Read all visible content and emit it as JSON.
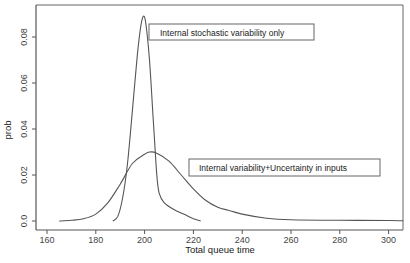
{
  "chart_data": {
    "type": "line",
    "title": "",
    "xlabel": "Total queue time",
    "ylabel": "prob",
    "xlim": [
      155,
      306
    ],
    "ylim": [
      -0.003,
      0.093
    ],
    "grid": false,
    "legend": "none (inline boxed annotations)",
    "x_ticks": [
      160,
      180,
      200,
      220,
      240,
      260,
      280,
      300
    ],
    "x_tick_labels": [
      "160",
      "180",
      "200",
      "220",
      "240",
      "260",
      "280",
      "300"
    ],
    "y_ticks": [
      0.0,
      0.02,
      0.04,
      0.06,
      0.08
    ],
    "y_tick_labels": [
      "0.0",
      "0.02",
      "0.04",
      "0.06",
      "0.08"
    ],
    "series": [
      {
        "name": "Internal stochastic variability only",
        "x": [
          187,
          189,
          191,
          193,
          195,
          197,
          198.5,
          199.5,
          200.5,
          202,
          203.5,
          205,
          206,
          208,
          212,
          216,
          220,
          223
        ],
        "values": [
          0.0,
          0.002,
          0.01,
          0.025,
          0.048,
          0.072,
          0.085,
          0.089,
          0.086,
          0.07,
          0.045,
          0.02,
          0.012,
          0.008,
          0.005,
          0.003,
          0.001,
          0.0
        ]
      },
      {
        "name": "Internal variability+Uncertainty in inputs",
        "x": [
          165,
          170,
          175,
          180,
          185,
          190,
          195,
          200,
          202,
          205,
          210,
          215,
          220,
          225,
          230,
          235,
          240,
          250,
          260,
          280,
          300,
          306
        ],
        "values": [
          0.0,
          0.0003,
          0.001,
          0.003,
          0.008,
          0.016,
          0.025,
          0.029,
          0.03,
          0.0295,
          0.026,
          0.02,
          0.014,
          0.009,
          0.006,
          0.0045,
          0.003,
          0.0012,
          0.0005,
          0.0003,
          0.0002,
          0.0001
        ]
      }
    ],
    "annotations": [
      {
        "text": "Internal stochastic variability only",
        "attached_to": "Internal stochastic variability only",
        "position": "right of narrow peak, near top"
      },
      {
        "text": "Internal variability+Uncertainty in inputs",
        "attached_to": "Internal variability+Uncertainty in inputs",
        "position": "right of wide peak"
      }
    ]
  },
  "axes": {
    "xlabel": "Total queue time",
    "ylabel": "prob"
  },
  "annotations": {
    "narrow": "Internal stochastic variability only",
    "wide": "Internal variability+Uncertainty in inputs"
  },
  "colors": {
    "line": "#555555",
    "frame": "#555555",
    "background": "#ffffff"
  }
}
